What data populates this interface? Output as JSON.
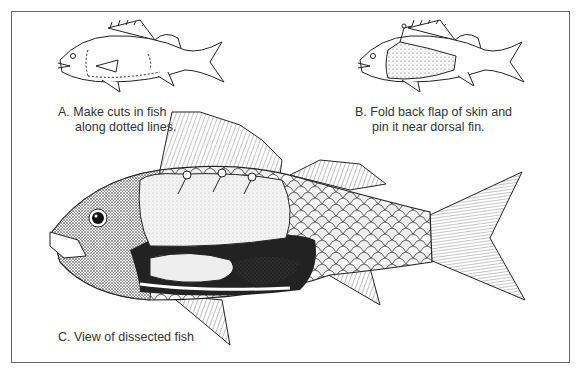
{
  "figure": {
    "panels": [
      {
        "id": "A",
        "label": "A.",
        "caption_line1": "Make cuts in fish",
        "caption_line2": "along dotted lines.",
        "illustration": "outline-fish-with-dotted-cut-lines"
      },
      {
        "id": "B",
        "label": "B.",
        "caption_line1": "Fold back flap of skin and",
        "caption_line2": "pin it near dorsal fin.",
        "illustration": "fish-with-skin-flap-pinned"
      },
      {
        "id": "C",
        "label": "C.",
        "caption_line1": "View of dissected fish",
        "illustration": "dissected-fish-internal-organs"
      }
    ],
    "colors": {
      "ink": "#222222",
      "border": "#666666",
      "caption": "#333333",
      "background": "#ffffff"
    }
  }
}
